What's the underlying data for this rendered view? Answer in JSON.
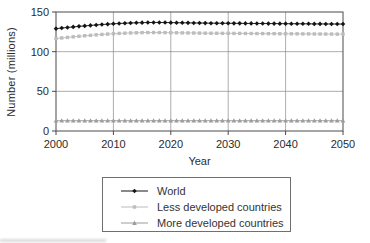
{
  "figure": {
    "y_axis_label": "Number (millions)",
    "x_axis_label": "Year"
  },
  "colors": {
    "axis": "#4a4a4a",
    "grid": "#8a8a8a",
    "text": "#2b2b2b",
    "world": "#141414",
    "less_developed": "#bcbcbc",
    "more_developed": "#9c9c9c"
  },
  "chart_data": {
    "type": "line",
    "title": "",
    "xlabel": "Year",
    "ylabel": "Number (millions)",
    "xlim": [
      2000,
      2050
    ],
    "ylim": [
      0,
      150
    ],
    "xticks": [
      2000,
      2010,
      2020,
      2030,
      2040,
      2050
    ],
    "yticks": [
      0,
      50,
      100,
      150
    ],
    "grid": true,
    "legend_position": "bottom",
    "x": [
      2000,
      2001,
      2002,
      2003,
      2004,
      2005,
      2006,
      2007,
      2008,
      2009,
      2010,
      2011,
      2012,
      2013,
      2014,
      2015,
      2016,
      2017,
      2018,
      2019,
      2020,
      2021,
      2022,
      2023,
      2024,
      2025,
      2026,
      2027,
      2028,
      2029,
      2030,
      2031,
      2032,
      2033,
      2034,
      2035,
      2036,
      2037,
      2038,
      2039,
      2040,
      2041,
      2042,
      2043,
      2044,
      2045,
      2046,
      2047,
      2048,
      2049,
      2050
    ],
    "series": [
      {
        "name": "World",
        "marker": "diamond",
        "color": "#141414",
        "values": [
          129.0,
          129.8,
          130.5,
          131.2,
          131.9,
          132.5,
          133.1,
          133.7,
          134.2,
          134.7,
          135.1,
          135.5,
          135.9,
          136.2,
          136.4,
          136.6,
          136.7,
          136.8,
          136.8,
          136.7,
          136.6,
          136.5,
          136.4,
          136.3,
          136.2,
          136.1,
          136.0,
          135.9,
          135.9,
          135.8,
          135.8,
          135.7,
          135.7,
          135.6,
          135.6,
          135.5,
          135.5,
          135.4,
          135.4,
          135.3,
          135.3,
          135.2,
          135.2,
          135.1,
          135.1,
          135.0,
          135.0,
          134.9,
          134.9,
          134.8,
          134.8
        ]
      },
      {
        "name": "Less developed countries",
        "marker": "square",
        "color": "#bcbcbc",
        "values": [
          116.5,
          117.3,
          118.0,
          118.7,
          119.4,
          120.0,
          120.6,
          121.2,
          121.7,
          122.2,
          122.6,
          123.0,
          123.3,
          123.6,
          123.8,
          124.0,
          124.1,
          124.1,
          124.1,
          124.0,
          123.9,
          123.8,
          123.7,
          123.6,
          123.5,
          123.4,
          123.3,
          123.2,
          123.2,
          123.1,
          123.1,
          123.0,
          123.0,
          122.9,
          122.9,
          122.8,
          122.8,
          122.7,
          122.7,
          122.6,
          122.6,
          122.5,
          122.5,
          122.4,
          122.4,
          122.3,
          122.3,
          122.2,
          122.2,
          122.1,
          122.1
        ]
      },
      {
        "name": "More developed countries",
        "marker": "triangle",
        "color": "#9c9c9c",
        "values": [
          13.0,
          13.0,
          13.0,
          13.0,
          13.0,
          13.0,
          13.0,
          13.0,
          13.0,
          13.0,
          13.0,
          13.0,
          13.0,
          13.0,
          13.0,
          13.0,
          13.0,
          13.0,
          13.0,
          13.0,
          13.0,
          13.0,
          13.0,
          13.0,
          13.0,
          13.0,
          13.0,
          13.0,
          13.0,
          13.0,
          13.0,
          13.0,
          13.0,
          13.0,
          13.0,
          13.0,
          13.0,
          13.0,
          13.0,
          13.0,
          13.0,
          13.0,
          13.0,
          13.0,
          13.0,
          13.0,
          13.0,
          13.0,
          13.0,
          13.0,
          13.0
        ]
      }
    ]
  }
}
